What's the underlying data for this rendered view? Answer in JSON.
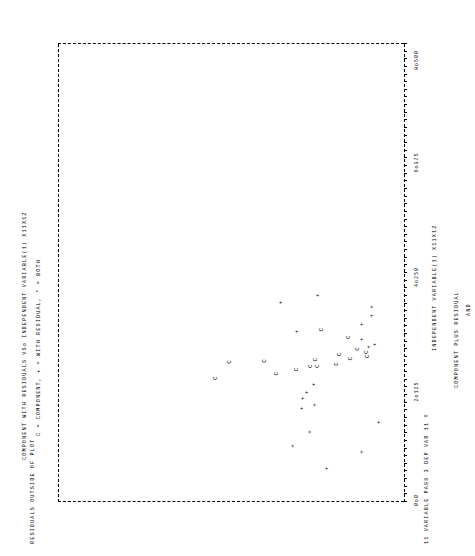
{
  "page": {
    "top_left_note": "11 VARIABLE PASS 3   DEP VAR 11 Y",
    "bottom_note": "RESIDUALS OUTSIDE OF PLOT"
  },
  "chart_data": {
    "type": "scatter",
    "title": "COMPONENT WITH RESIDUALS VSo INDEPENDENT VARIABLE(1) X11X12",
    "subtitle": "C = COMPONENT, + = WITH RESIDUAL, * = BOTH",
    "xlabel": "INDEPENDENT VARIABLE(1) X11X12",
    "ylabel": "COMPONENT PLUS RESIDUAL",
    "ylabel2": "AND",
    "ylabel3": "COMPONENT",
    "xticks": [
      "0o0",
      "2o125",
      "4o250",
      "6o375",
      "8o500"
    ],
    "xlim": [
      0,
      8.5
    ],
    "ylim": [
      0,
      8.5
    ],
    "grid": false,
    "legend": "none",
    "markers": {
      "component": "C",
      "with_residual": "+",
      "both": "*"
    },
    "points": [
      {
        "x": 0.62,
        "y": 1.88,
        "m": "+"
      },
      {
        "x": 0.93,
        "y": 1.02,
        "m": "+"
      },
      {
        "x": 1.04,
        "y": 2.72,
        "m": "+"
      },
      {
        "x": 1.3,
        "y": 2.3,
        "m": "+"
      },
      {
        "x": 1.48,
        "y": 0.62,
        "m": "+"
      },
      {
        "x": 1.74,
        "y": 2.5,
        "m": "+"
      },
      {
        "x": 1.8,
        "y": 2.18,
        "m": "+"
      },
      {
        "x": 1.92,
        "y": 2.48,
        "m": "+"
      },
      {
        "x": 2.04,
        "y": 2.38,
        "m": "+"
      },
      {
        "x": 2.18,
        "y": 2.22,
        "m": "+"
      },
      {
        "x": 2.3,
        "y": 4.62,
        "m": "C"
      },
      {
        "x": 2.38,
        "y": 3.12,
        "m": "C"
      },
      {
        "x": 2.46,
        "y": 2.62,
        "m": "C"
      },
      {
        "x": 2.52,
        "y": 2.28,
        "m": "C"
      },
      {
        "x": 2.52,
        "y": 2.12,
        "m": "C"
      },
      {
        "x": 2.56,
        "y": 1.64,
        "m": "C"
      },
      {
        "x": 2.6,
        "y": 4.28,
        "m": "C"
      },
      {
        "x": 2.62,
        "y": 3.42,
        "m": "C"
      },
      {
        "x": 2.64,
        "y": 2.16,
        "m": "C"
      },
      {
        "x": 2.66,
        "y": 1.3,
        "m": "C"
      },
      {
        "x": 2.7,
        "y": 0.88,
        "m": "C"
      },
      {
        "x": 2.74,
        "y": 1.58,
        "m": "C"
      },
      {
        "x": 2.78,
        "y": 0.92,
        "m": "C"
      },
      {
        "x": 2.84,
        "y": 1.12,
        "m": "C"
      },
      {
        "x": 2.88,
        "y": 0.86,
        "m": "+"
      },
      {
        "x": 2.92,
        "y": 0.72,
        "m": "+"
      },
      {
        "x": 3.02,
        "y": 1.04,
        "m": "+"
      },
      {
        "x": 3.06,
        "y": 1.36,
        "m": "C"
      },
      {
        "x": 3.16,
        "y": 2.62,
        "m": "+"
      },
      {
        "x": 3.2,
        "y": 2.02,
        "m": "C"
      },
      {
        "x": 3.3,
        "y": 1.02,
        "m": "+"
      },
      {
        "x": 3.46,
        "y": 0.78,
        "m": "+"
      },
      {
        "x": 3.62,
        "y": 0.78,
        "m": "+"
      },
      {
        "x": 3.7,
        "y": 3.02,
        "m": "+"
      },
      {
        "x": 3.84,
        "y": 2.12,
        "m": "+"
      }
    ]
  }
}
